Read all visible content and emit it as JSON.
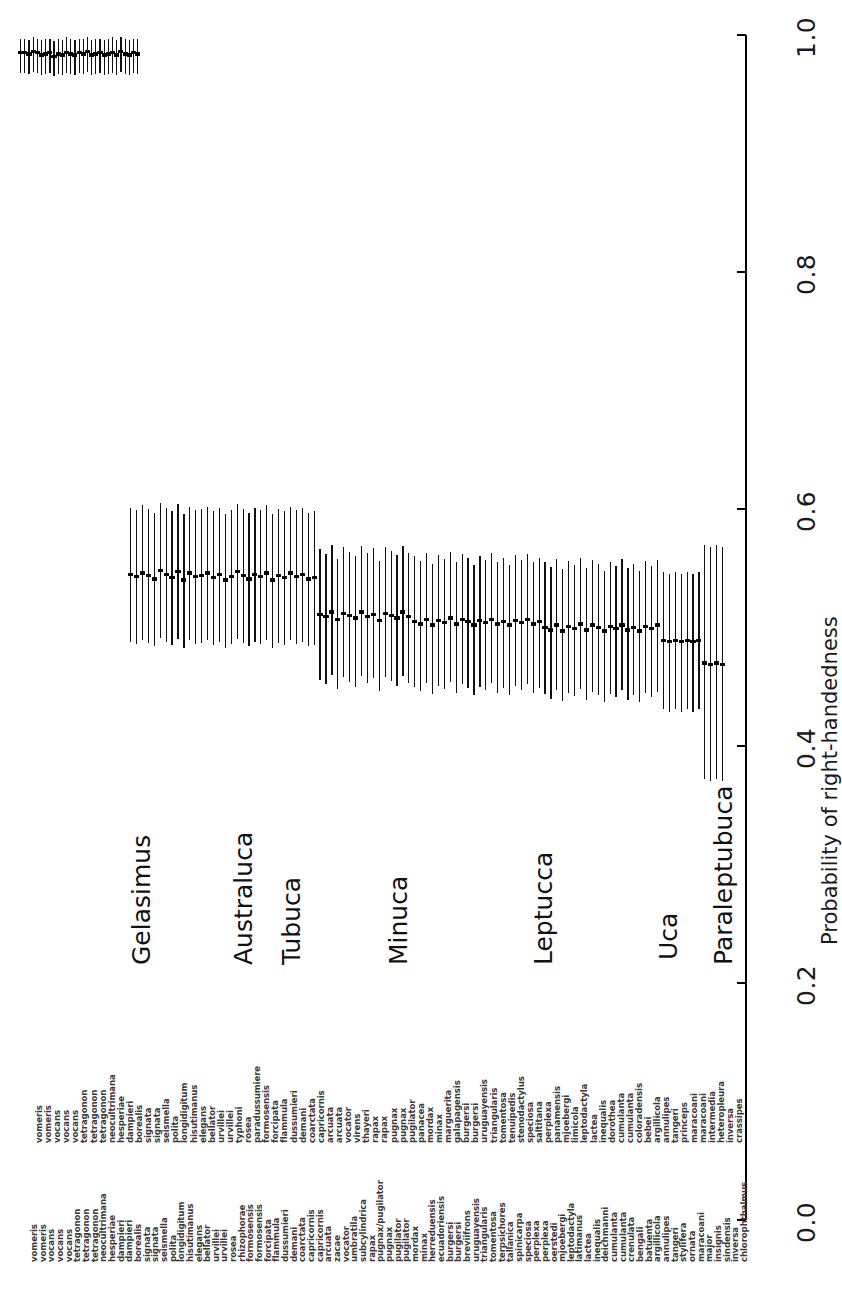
{
  "figure": {
    "type": "forest-plot",
    "orientation": "rotated-90",
    "axis_title": "Probability of right-handedness"
  },
  "axis": {
    "ticks": [
      "0.0",
      "0.2",
      "0.4",
      "0.6",
      "0.8",
      "1.0"
    ],
    "values": [
      0.0,
      0.2,
      0.4,
      0.6,
      0.8,
      1.0
    ],
    "min": 0.0,
    "max": 1.0
  },
  "genera": [
    {
      "name": "Gelasimus"
    },
    {
      "name": "Australuca"
    },
    {
      "name": "Tubuca"
    },
    {
      "name": "Minuca"
    },
    {
      "name": "Leptucca"
    },
    {
      "name": "Uca"
    },
    {
      "name": "Paraleptubuca"
    }
  ],
  "chart_data": {
    "type": "scatter",
    "title": "",
    "xlabel": "",
    "ylabel": "Probability of right-handedness",
    "ylim": [
      0.0,
      1.0
    ],
    "grid": false,
    "legend": "none",
    "species": [
      "vomeris",
      "vomeris",
      "vocans",
      "vocans",
      "vocans",
      "tetragonon",
      "tetragonon",
      "tetragonon",
      "neocultrimana",
      "hesperiae",
      "dampieri",
      "dampieri",
      "borealis",
      "signata",
      "signata",
      "seismella",
      "polita",
      "longidigitum",
      "hisutimanus",
      "elegans",
      "bellator",
      "urvillei",
      "urvillei",
      "typhoni",
      "rosea",
      "paradussumiere",
      "formosensis",
      "formosensis",
      "forcipata",
      "flammula",
      "dussumieri",
      "dussumieri",
      "demani",
      "coarctata",
      "coarctata",
      "capricornis",
      "capricornis",
      "capricornis",
      "arcuata",
      "arcuata",
      "arcuata",
      "zacae",
      "vocator",
      "vocator",
      "umbratila",
      "virens",
      "subcylindrica",
      "thayeri",
      "rapax",
      "rapax",
      "rapax",
      "pugnax/pugilator",
      "pugnax",
      "pugnax",
      "pugnax",
      "pugilator",
      "pugilator",
      "pugilator",
      "panacea",
      "mordax",
      "mordax",
      "minax",
      "minax",
      "marguerita",
      "herreduensis",
      "galapagensis",
      "ecuadoriensis",
      "burgersi",
      "burgersi",
      "breviifrons",
      "uruguayensis",
      "uruguayensis",
      "triangularis",
      "triangularis",
      "tomentosa",
      "tomentosa",
      "terpsichores",
      "tenuipedis",
      "tallanica",
      "stenodactylus",
      "spinicarpa",
      "speciosa",
      "speciosa",
      "saltitana",
      "perplexa",
      "perplexa",
      "perplexa",
      "panamensis",
      "oerstedi",
      "mjoebergi",
      "mjoebergi",
      "limicola",
      "leptodactyla",
      "leptodactyla",
      "latimanus",
      "lactea",
      "lactea",
      "inequalis",
      "deichmanni",
      "dorothea",
      "cumulanta",
      "cumulanta",
      "cumulanta",
      "cumulanta",
      "bengali",
      "coloradensis",
      "batuenta",
      "bebei",
      "argillicola",
      "argillicola",
      "annulipes",
      "annulipes",
      "tangeri",
      "tangeri",
      "princeps",
      "stylifera",
      "maracoani",
      "ornata",
      "maracoani",
      "maracoani",
      "intermedia",
      "major",
      "heteropleura",
      "insignis",
      "sindensis",
      "inversa",
      "inversa",
      "crassipes",
      "chlorophthalmus"
    ],
    "series": [
      {
        "name": "probability of right-handedness",
        "estimates": [
          0.985,
          0.985,
          0.984,
          0.986,
          0.985,
          0.983,
          0.984,
          0.985,
          0.982,
          0.984,
          0.983,
          0.985,
          0.984,
          0.983,
          0.985,
          0.984,
          0.986,
          0.983,
          0.984,
          0.985,
          0.983,
          0.984,
          0.985,
          0.983,
          0.986,
          0.984,
          0.983,
          0.985,
          0.984,
          0.545,
          0.543,
          0.546,
          0.544,
          0.541,
          0.548,
          0.545,
          0.542,
          0.547,
          0.54,
          0.546,
          0.543,
          0.544,
          0.546,
          0.542,
          0.545,
          0.54,
          0.543,
          0.547,
          0.544,
          0.541,
          0.545,
          0.543,
          0.546,
          0.54,
          0.544,
          0.542,
          0.546,
          0.543,
          0.545,
          0.541,
          0.542,
          0.511,
          0.509,
          0.513,
          0.507,
          0.512,
          0.51,
          0.508,
          0.513,
          0.509,
          0.511,
          0.506,
          0.512,
          0.51,
          0.508,
          0.513,
          0.509,
          0.505,
          0.503,
          0.507,
          0.502,
          0.506,
          0.504,
          0.508,
          0.503,
          0.507,
          0.505,
          0.502,
          0.506,
          0.504,
          0.507,
          0.503,
          0.505,
          0.502,
          0.506,
          0.504,
          0.507,
          0.503,
          0.505,
          0.5,
          0.498,
          0.502,
          0.497,
          0.501,
          0.499,
          0.503,
          0.498,
          0.502,
          0.5,
          0.497,
          0.501,
          0.499,
          0.502,
          0.498,
          0.5,
          0.497,
          0.501,
          0.499,
          0.502,
          0.489,
          0.488,
          0.489,
          0.488,
          0.489,
          0.488,
          0.489,
          0.47,
          0.469,
          0.47,
          0.469
        ],
        "lower": [
          0.968,
          0.968,
          0.967,
          0.969,
          0.968,
          0.966,
          0.967,
          0.968,
          0.965,
          0.967,
          0.966,
          0.968,
          0.967,
          0.966,
          0.968,
          0.967,
          0.969,
          0.966,
          0.967,
          0.968,
          0.966,
          0.967,
          0.968,
          0.966,
          0.969,
          0.967,
          0.966,
          0.968,
          0.967,
          0.488,
          0.486,
          0.489,
          0.487,
          0.484,
          0.491,
          0.488,
          0.485,
          0.49,
          0.483,
          0.489,
          0.486,
          0.487,
          0.489,
          0.485,
          0.488,
          0.483,
          0.486,
          0.49,
          0.487,
          0.484,
          0.488,
          0.486,
          0.489,
          0.483,
          0.487,
          0.485,
          0.489,
          0.486,
          0.488,
          0.484,
          0.485,
          0.456,
          0.452,
          0.46,
          0.448,
          0.458,
          0.454,
          0.45,
          0.459,
          0.453,
          0.457,
          0.446,
          0.458,
          0.455,
          0.451,
          0.459,
          0.453,
          0.45,
          0.446,
          0.453,
          0.444,
          0.451,
          0.448,
          0.454,
          0.445,
          0.452,
          0.449,
          0.443,
          0.45,
          0.447,
          0.453,
          0.445,
          0.449,
          0.443,
          0.451,
          0.447,
          0.452,
          0.445,
          0.449,
          0.444,
          0.44,
          0.447,
          0.438,
          0.445,
          0.442,
          0.448,
          0.439,
          0.446,
          0.443,
          0.437,
          0.444,
          0.441,
          0.447,
          0.439,
          0.443,
          0.437,
          0.445,
          0.441,
          0.446,
          0.431,
          0.429,
          0.431,
          0.429,
          0.431,
          0.429,
          0.431,
          0.372,
          0.37,
          0.372,
          0.37
        ],
        "upper": [
          0.997,
          0.997,
          0.996,
          0.998,
          0.997,
          0.996,
          0.997,
          0.997,
          0.995,
          0.997,
          0.996,
          0.998,
          0.997,
          0.996,
          0.997,
          0.997,
          0.998,
          0.996,
          0.997,
          0.997,
          0.996,
          0.997,
          0.998,
          0.996,
          0.998,
          0.997,
          0.996,
          0.997,
          0.997,
          0.601,
          0.599,
          0.603,
          0.6,
          0.597,
          0.605,
          0.601,
          0.598,
          0.604,
          0.596,
          0.602,
          0.599,
          0.6,
          0.602,
          0.598,
          0.601,
          0.596,
          0.599,
          0.604,
          0.6,
          0.597,
          0.601,
          0.599,
          0.603,
          0.596,
          0.6,
          0.598,
          0.602,
          0.599,
          0.601,
          0.597,
          0.598,
          0.566,
          0.562,
          0.57,
          0.558,
          0.568,
          0.564,
          0.56,
          0.569,
          0.563,
          0.567,
          0.556,
          0.568,
          0.565,
          0.561,
          0.569,
          0.563,
          0.56,
          0.556,
          0.563,
          0.554,
          0.561,
          0.558,
          0.564,
          0.555,
          0.562,
          0.559,
          0.553,
          0.56,
          0.557,
          0.563,
          0.555,
          0.559,
          0.553,
          0.561,
          0.557,
          0.562,
          0.555,
          0.559,
          0.555,
          0.551,
          0.558,
          0.549,
          0.556,
          0.553,
          0.559,
          0.55,
          0.557,
          0.554,
          0.548,
          0.555,
          0.552,
          0.558,
          0.55,
          0.554,
          0.548,
          0.556,
          0.552,
          0.557,
          0.547,
          0.545,
          0.547,
          0.545,
          0.547,
          0.545,
          0.547,
          0.57,
          0.568,
          0.57,
          0.568
        ]
      }
    ]
  },
  "species_labels_upper_row": [
    "vomeris",
    "vomeris",
    "vocans",
    "vocans",
    "vocans",
    "tetragonon",
    "tetragonon",
    "tetragonon",
    "neocultrimana",
    "hesperiae",
    "dampieri",
    "borealis",
    "signata",
    "signata",
    "seismella",
    "polita",
    "longidigitum",
    "hisutimanus",
    "elegans",
    "bellator",
    "urvillei",
    "urvillei",
    "typhoni",
    "rosea",
    "paradussumiere",
    "formosensis",
    "forcipata",
    "flammula",
    "dussumieri",
    "demani",
    "coarctata",
    "capricornis",
    "arcuata",
    "arcuata",
    "vocator",
    "virens",
    "thayeri",
    "rapax",
    "rapax",
    "pugnax",
    "pugnax",
    "pugilator",
    "panacea",
    "mordax",
    "minax",
    "marguerita",
    "galapagensis",
    "burgersi",
    "burgersi",
    "uruguayensis",
    "triangularis",
    "tomentosa",
    "tenuipedis",
    "stenodactylus",
    "speciosa",
    "saltitana",
    "perplexa",
    "panamensis",
    "mjoebergi",
    "limicola",
    "leptodactyla",
    "lactea",
    "inequalis",
    "dorothea",
    "cumulanta",
    "cumulanta",
    "coloradensis",
    "bebei",
    "argillicola",
    "annulipes",
    "tangeri",
    "princeps",
    "maracoani",
    "maracoani",
    "intermedia",
    "heteropleura",
    "inversa",
    "crassipes"
  ],
  "species_labels_lower_row": [
    "vomeris",
    "vomeris",
    "vocans",
    "vocans",
    "vocans",
    "tetragonon",
    "tetragonon",
    "tetragonon",
    "neocultrimana",
    "hesperiae",
    "dampieri",
    "dampieri",
    "borealis",
    "signata",
    "signata",
    "seismella",
    "polita",
    "longidigitum",
    "hisutimanus",
    "elegans",
    "bellator",
    "urvillei",
    "urvillei",
    "rosea",
    "rhizophorae",
    "formosensis",
    "formosensis",
    "forcipata",
    "flammula",
    "dussumieri",
    "demani",
    "coarctata",
    "capricornis",
    "capricornis",
    "arcuata",
    "zacae",
    "vocator",
    "umbratila",
    "subcylindrica",
    "rapax",
    "pugnax/pugilator",
    "pugnax",
    "pugilator",
    "pugilator",
    "mordax",
    "minax",
    "herreduensis",
    "ecuadoriensis",
    "burgersi",
    "burgersi",
    "breviifrons",
    "uruguayensis",
    "triangularis",
    "tomentosa",
    "terpsichores",
    "tallanica",
    "spinicarpa",
    "speciosa",
    "perplexa",
    "perplexa",
    "oerstedi",
    "mjoebergi",
    "leptodactyla",
    "latimanus",
    "lactea",
    "inequalis",
    "deichmanni",
    "cumulanta",
    "cumulanta",
    "crenulata",
    "bengali",
    "batuenta",
    "argillicola",
    "annulipes",
    "tangeri",
    "stylifera",
    "ornata",
    "maracoani",
    "major",
    "insignis",
    "sindensis",
    "inversa",
    "chlorophthalmus"
  ]
}
